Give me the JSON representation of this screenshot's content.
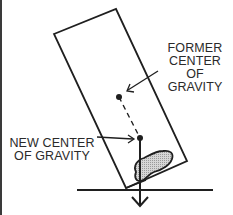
{
  "diagram": {
    "type": "center-of-gravity illustration",
    "labels": {
      "former_cog": [
        "FORMER",
        "CENTER",
        "OF",
        "GRAVITY"
      ],
      "new_cog": [
        "NEW CENTER",
        "OF GRAVITY"
      ]
    },
    "elements": {
      "tilted_block": {
        "corners": [
          [
            54,
            34
          ],
          [
            116,
            9
          ],
          [
            187,
            161
          ],
          [
            126,
            188
          ]
        ]
      },
      "former_cog_point": [
        119,
        97
      ],
      "new_cog_point": [
        140,
        138
      ],
      "ground_line": {
        "x1": 77,
        "x2": 213,
        "y": 190
      },
      "weight_vector": {
        "from": [
          140,
          138
        ],
        "to": [
          140,
          206
        ]
      },
      "shaded_mass": {
        "center": [
          158,
          166
        ]
      }
    },
    "colors": {
      "stroke": "#1f1f1f",
      "shade": "#b8b8b8",
      "background": "#ffffff"
    }
  }
}
